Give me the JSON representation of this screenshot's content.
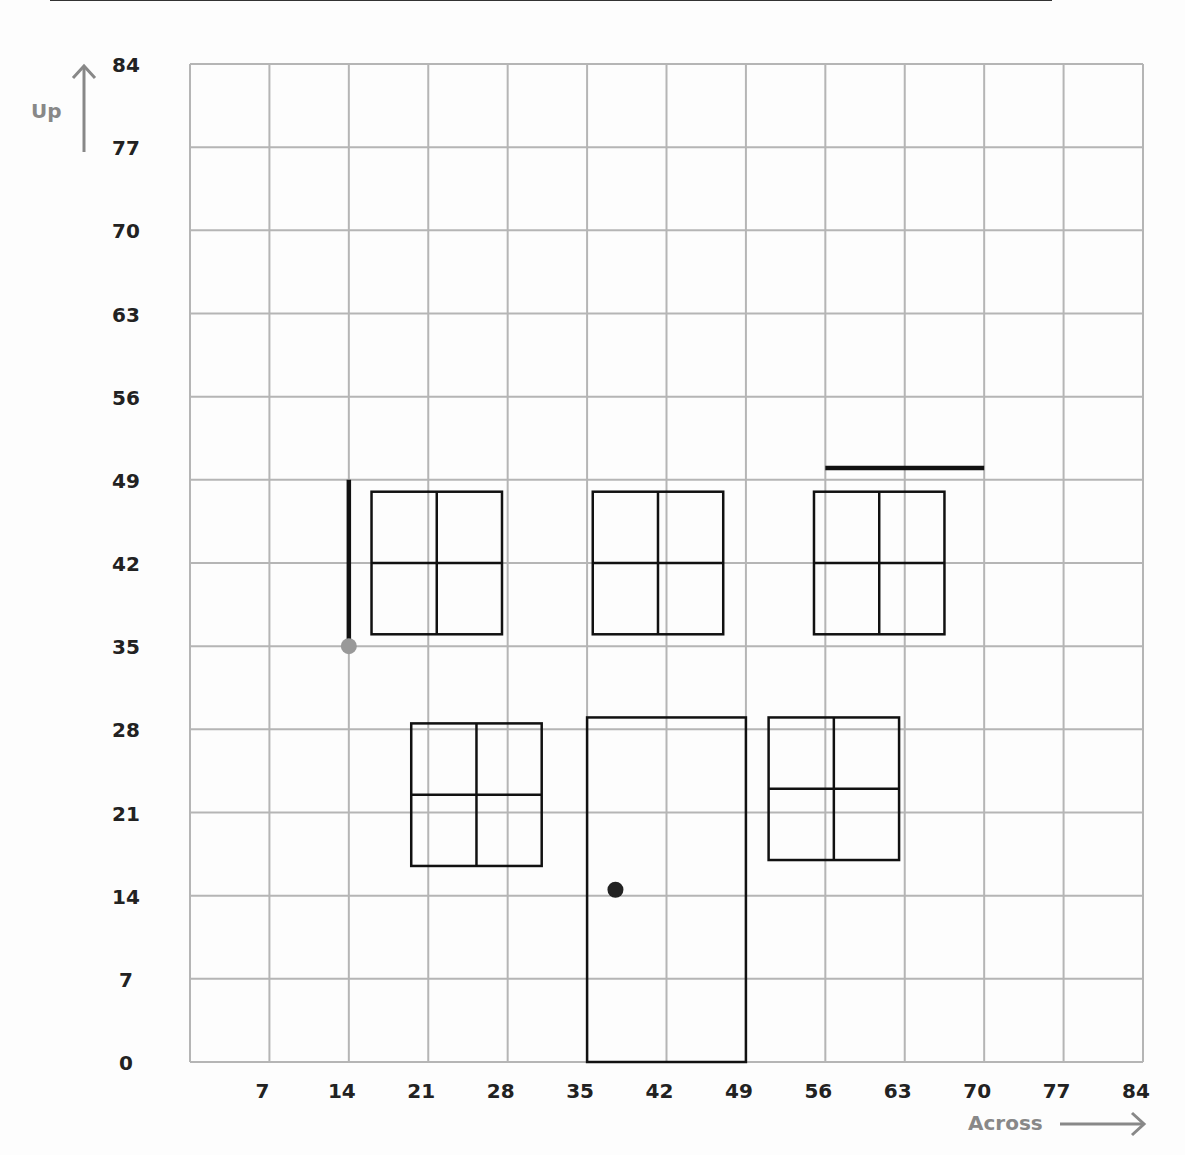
{
  "chart_data": {
    "type": "grid-diagram",
    "title": "",
    "xlabel": "Across",
    "ylabel": "Up",
    "xlim": [
      0,
      84
    ],
    "ylim": [
      0,
      84
    ],
    "grid": true,
    "grid_step": 7,
    "x_ticks": [
      "7",
      "14",
      "21",
      "28",
      "35",
      "42",
      "49",
      "56",
      "63",
      "70",
      "77",
      "84"
    ],
    "y_ticks": [
      "0",
      "7",
      "14",
      "21",
      "28",
      "35",
      "42",
      "49",
      "56",
      "63",
      "70",
      "77",
      "84"
    ],
    "shapes": [
      {
        "name": "window-upper-left",
        "type": "window",
        "x0": 16,
        "y0": 36,
        "x1": 27.5,
        "y1": 48
      },
      {
        "name": "window-upper-middle",
        "type": "window",
        "x0": 35.5,
        "y0": 36,
        "x1": 47,
        "y1": 48
      },
      {
        "name": "window-upper-right",
        "type": "window",
        "x0": 55,
        "y0": 36,
        "x1": 66.5,
        "y1": 48
      },
      {
        "name": "window-lower-left",
        "type": "window",
        "x0": 19.5,
        "y0": 16.5,
        "x1": 31,
        "y1": 28.5
      },
      {
        "name": "window-lower-right",
        "type": "window",
        "x0": 51,
        "y0": 17,
        "x1": 62.5,
        "y1": 29
      },
      {
        "name": "door",
        "type": "rect",
        "x0": 35,
        "y0": 0,
        "x1": 49,
        "y1": 29
      },
      {
        "name": "door-knob",
        "type": "point",
        "x": 37.5,
        "y": 14.5,
        "color": "#222222"
      },
      {
        "name": "vertical-segment",
        "type": "line",
        "x0": 14,
        "y0": 35,
        "x1": 14,
        "y1": 49
      },
      {
        "name": "vertical-segment-endpoint",
        "type": "point",
        "x": 14,
        "y": 35,
        "color": "#999999"
      },
      {
        "name": "horizontal-segment",
        "type": "line",
        "x0": 56,
        "y0": 50,
        "x1": 70,
        "y1": 50
      }
    ]
  },
  "axes": {
    "x_label": "Across",
    "y_label": "Up"
  },
  "colors": {
    "grid": "#b5b5b5",
    "shape": "#111111",
    "axis_label": "#888888",
    "tick": "#222222",
    "grey_point": "#999999"
  }
}
